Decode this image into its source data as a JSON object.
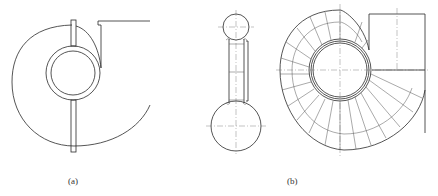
{
  "figure": {
    "panels": [
      {
        "id": "a",
        "label": "(a)",
        "description": "Spiral volute casing front view with inlet ring and central divider plate"
      },
      {
        "id": "b",
        "label": "(b)",
        "description": "Segmented volute side view and front view with radial segment lines and rectangular outlet"
      }
    ]
  }
}
